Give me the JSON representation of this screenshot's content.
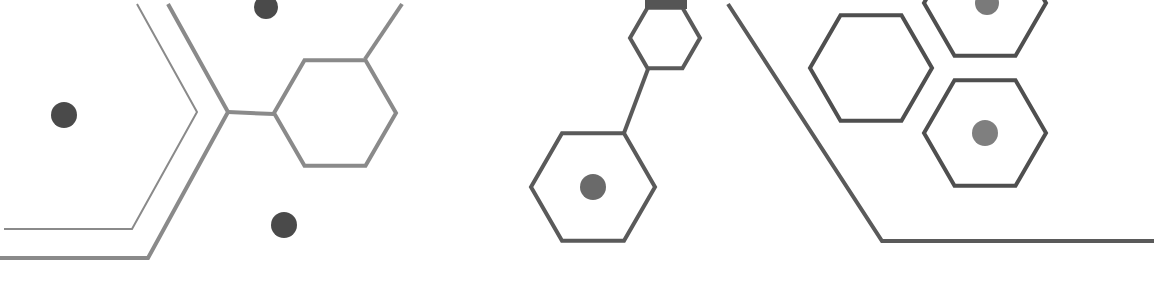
{
  "graphic": {
    "description": "Decorative molecular/hexagon line-art pattern",
    "colors": {
      "background": "#ffffff",
      "stroke_light": "#8a8a8a",
      "stroke_dark": "#555555",
      "dot_dark": "#4a4a4a",
      "dot_mid": "#7a7a7a"
    },
    "hexagons": [
      {
        "name": "hex-left",
        "cx": 335,
        "cy": 113,
        "r": 61,
        "stroke": "#8a8a8a",
        "width": 4
      },
      {
        "name": "hex-mid-small",
        "cx": 665,
        "cy": 38,
        "r": 35,
        "stroke": "#5a5a5a",
        "width": 4
      },
      {
        "name": "hex-mid-large",
        "cx": 593,
        "cy": 187,
        "r": 62,
        "stroke": "#5a5a5a",
        "width": 4
      },
      {
        "name": "hex-right-upper-left",
        "cx": 871,
        "cy": 68,
        "r": 61,
        "stroke": "#4f4f4f",
        "width": 4
      },
      {
        "name": "hex-right-top",
        "cx": 985,
        "cy": 3,
        "r": 61,
        "stroke": "#4f4f4f",
        "width": 4
      },
      {
        "name": "hex-right-lower",
        "cx": 985,
        "cy": 133,
        "r": 61,
        "stroke": "#4f4f4f",
        "width": 4
      }
    ],
    "dots": [
      {
        "name": "dot-left",
        "cx": 64,
        "cy": 115,
        "r": 13,
        "fill": "#4a4a4a"
      },
      {
        "name": "dot-top",
        "cx": 266,
        "cy": 7,
        "r": 12,
        "fill": "#4a4a4a"
      },
      {
        "name": "dot-bottom",
        "cx": 284,
        "cy": 225,
        "r": 13,
        "fill": "#4a4a4a"
      },
      {
        "name": "dot-mid-hex",
        "cx": 593,
        "cy": 187,
        "r": 13,
        "fill": "#6a6a6a"
      },
      {
        "name": "dot-right-top",
        "cx": 987,
        "cy": 3,
        "r": 12,
        "fill": "#7a7a7a"
      },
      {
        "name": "dot-right-hex",
        "cx": 985,
        "cy": 133,
        "r": 13,
        "fill": "#7f7f7f"
      }
    ],
    "polylines": [
      {
        "name": "bracket-inner",
        "points": "137,4 197,112 132,229 4,229",
        "stroke": "#8a8a8a",
        "width": 2
      },
      {
        "name": "bracket-outer",
        "points": "168,4 228,112 148,258 0,258",
        "stroke": "#8a8a8a",
        "width": 4
      },
      {
        "name": "connector-left",
        "points": "228,112 274,114",
        "stroke": "#8a8a8a",
        "width": 4
      },
      {
        "name": "connector-left-up",
        "points": "365,59 402,4",
        "stroke": "#8a8a8a",
        "width": 4
      },
      {
        "name": "connector-mid",
        "points": "648,69 624,133",
        "stroke": "#5a5a5a",
        "width": 4
      },
      {
        "name": "right-frame",
        "points": "728,4 882,241 1154,241",
        "stroke": "#5a5a5a",
        "width": 4
      }
    ],
    "caps": [
      {
        "name": "cap-mid-top",
        "x": 645,
        "y": 0,
        "w": 42,
        "h": 9,
        "fill": "#555555"
      }
    ]
  }
}
